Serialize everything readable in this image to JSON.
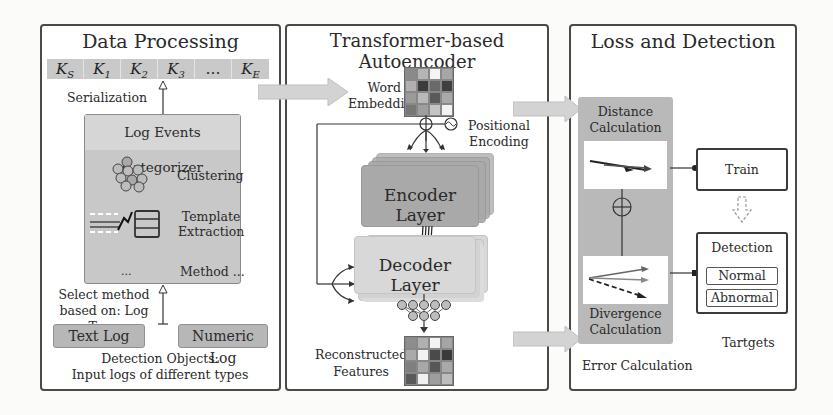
{
  "panels": {
    "data_processing": {
      "title": "Data Processing",
      "sequence": [
        {
          "base": "K",
          "sub": "S"
        },
        {
          "base": "K",
          "sub": "1"
        },
        {
          "base": "K",
          "sub": "2"
        },
        {
          "base": "K",
          "sub": "3"
        },
        {
          "base": "…",
          "sub": ""
        },
        {
          "base": "K",
          "sub": "E"
        }
      ],
      "serialization_label": "Serialization",
      "categorizer": {
        "title": "Log Events Categorizer",
        "methods": [
          {
            "label": "Clustering",
            "icon": "cluster-icon"
          },
          {
            "label_line1": "Template",
            "label_line2": "Extraction",
            "icon": "template-icon"
          }
        ],
        "ellipsis": "...",
        "method_more": "Method ..."
      },
      "select_method_line1": "Select method",
      "select_method_line2": "based on: Log Type",
      "log_types": [
        "Text Log",
        "Numeric Log"
      ],
      "detection_objects_line1": "Detection Objects:",
      "detection_objects_line2": "Input logs of different types"
    },
    "autoencoder": {
      "title": "Transformer-based Autoencoder",
      "word_embedding_line1": "Word",
      "word_embedding_line2": "Embedding",
      "positional_line1": "Positional",
      "positional_line2": "Encoding",
      "encoder_label": "Encoder Layer",
      "decoder_label": "Decoder Layer",
      "reconstructed_line1": "Reconstructed",
      "reconstructed_line2": "Features",
      "embedding_grid": [
        [
          "#8a8a8a",
          "#b5b5b5",
          "#f4f4f4",
          "#a6a6a6"
        ],
        [
          "#b0b0b0",
          "#3c3c3c",
          "#6a6a6a",
          "#3f3f3f"
        ],
        [
          "#9a9a9a",
          "#b9b9b9",
          "#5a5a5a",
          "#a9a9a9"
        ],
        [
          "#777777",
          "#9e9e9e",
          "#c5c5c5",
          "#f2f2f2"
        ]
      ],
      "reconstructed_grid": [
        [
          "#8d8d8d",
          "#b0b0b0",
          "#f3f3f3",
          "#a5a5a5"
        ],
        [
          "#aaaaaa",
          "#f2f2f2",
          "#4a4a4a",
          "#3a3a3a"
        ],
        [
          "#7f7f7f",
          "#a8a8a8",
          "#575757",
          "#a9a9a9"
        ],
        [
          "#5a5a5a",
          "#f0f0f0",
          "#9e9e9e",
          "#bdbdbd"
        ]
      ]
    },
    "loss_detection": {
      "title": "Loss and Detection",
      "distance_line1": "Distance",
      "distance_line2": "Calculation",
      "divergence_line1": "Divergence",
      "divergence_line2": "Calculation",
      "error_calculation": "Error Calculation",
      "train_label": "Train",
      "detection_label": "Detection",
      "outcomes": [
        "Normal",
        "Abnormal"
      ],
      "targets_label": "Tartgets"
    }
  },
  "colors": {
    "panel_border": "#4a4a4a",
    "key_cell": "#c9c9c9",
    "encoder": "#a9a9a9",
    "decoder": "#d8d8d8",
    "error_box": "#b9b9b9",
    "flow_arrow": "#d3d3d3"
  }
}
